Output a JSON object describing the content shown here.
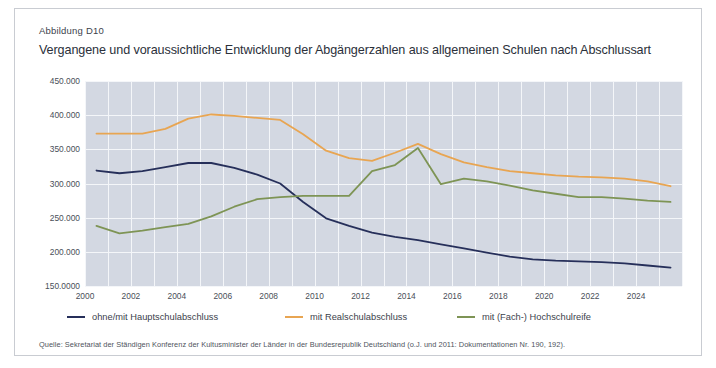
{
  "figure": {
    "label": "Abbildung D10",
    "title": "Vergangene und voraussichtliche Entwicklung der Abgängerzahlen aus allgemeinen Schulen nach Abschlussart",
    "source_note": "Quelle: Sekretariat der Ständigen Konferenz der Kultusminister der Länder in der Bundesrepublik Deutschland (o.J. und 2011: Dokumentationen Nr. 190, 192)."
  },
  "colors": {
    "hauptschulabschluss": "#262f5a",
    "realschulabschluss": "#e8a552",
    "hochschulreife": "#7e9455",
    "plot_background": "#d3d8e2",
    "gridline": "#f4f6f9",
    "frame_border": "#c9ccd2",
    "text": "#3c424c"
  },
  "chart_data": {
    "type": "line",
    "title": "Vergangene und voraussichtliche Entwicklung der Abgängerzahlen aus allgemeinen Schulen nach Abschlussart",
    "xlabel": "",
    "ylabel": "",
    "xlim": [
      2000,
      2026
    ],
    "ylim": [
      150000,
      450000
    ],
    "grid": true,
    "legend_position": "bottom-left",
    "ytick_labels": [
      "450.000",
      "400.000",
      "350.000",
      "300.000",
      "250.000",
      "200.000",
      "150.0000"
    ],
    "ytick_values": [
      450000,
      400000,
      350000,
      300000,
      250000,
      200000,
      150000
    ],
    "xtick_labels": [
      "2000",
      "2002",
      "2004",
      "2006",
      "2008",
      "2010",
      "2012",
      "2014",
      "2016",
      "2018",
      "2020",
      "2022",
      "2024"
    ],
    "xtick_values": [
      2000,
      2002,
      2004,
      2006,
      2008,
      2010,
      2012,
      2014,
      2016,
      2018,
      2020,
      2022,
      2024
    ],
    "x": [
      2000,
      2001,
      2002,
      2003,
      2004,
      2005,
      2006,
      2007,
      2008,
      2009,
      2010,
      2011,
      2012,
      2013,
      2014,
      2015,
      2016,
      2017,
      2018,
      2019,
      2020,
      2021,
      2022,
      2023,
      2024,
      2025
    ],
    "series": [
      {
        "name": "ohne/mit Hauptschulabschluss",
        "color": "#262f5a",
        "values": [
          319000,
          315000,
          318000,
          324000,
          330000,
          330000,
          323000,
          313000,
          300000,
          273000,
          249000,
          238000,
          228000,
          222000,
          217000,
          211000,
          205000,
          199000,
          193000,
          189000,
          187000,
          186000,
          185000,
          183000,
          180000,
          177000
        ]
      },
      {
        "name": "mit Realschulabschluss",
        "color": "#e8a552",
        "values": [
          373000,
          373000,
          373000,
          380000,
          395000,
          401000,
          399000,
          396000,
          393000,
          372000,
          348000,
          337000,
          333000,
          345000,
          358000,
          343000,
          331000,
          324000,
          318000,
          315000,
          312000,
          310000,
          309000,
          307000,
          303000,
          296000
        ]
      },
      {
        "name": "mit (Fach-) Hochschulreife",
        "color": "#7e9455",
        "values": [
          238000,
          227000,
          231000,
          236000,
          241000,
          252000,
          266000,
          277000,
          280000,
          282000,
          282000,
          282000,
          318000,
          327000,
          352000,
          299000,
          307000,
          303000,
          297000,
          290000,
          285000,
          280000,
          280000,
          278000,
          275000,
          273000
        ]
      }
    ]
  },
  "legend": [
    {
      "label": "ohne/mit Hauptschulabschluss",
      "color": "#262f5a"
    },
    {
      "label": "mit Realschulabschluss",
      "color": "#e8a552"
    },
    {
      "label": "mit (Fach-) Hochschulreife",
      "color": "#7e9455"
    }
  ]
}
